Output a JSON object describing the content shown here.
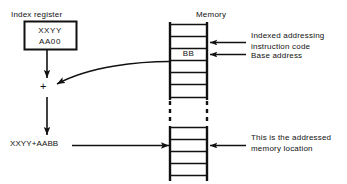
{
  "figure": {
    "stroke_color": "#111111",
    "background_color": "#ffffff"
  },
  "index_register": {
    "caption": "Index register",
    "line1": "XXYY",
    "line2": "AA00"
  },
  "operator": {
    "symbol": "+"
  },
  "result": {
    "label": "XXYY+AABB"
  },
  "memory": {
    "caption": "Memory",
    "cells": [
      {
        "value": ""
      },
      {
        "value": ""
      },
      {
        "value": "BB"
      },
      {
        "value": ""
      },
      {
        "value": ""
      },
      {
        "value": ""
      }
    ],
    "break_marker": "dashed-vertical-ellipsis",
    "lower_cells": [
      {
        "value": ""
      },
      {
        "value": ""
      },
      {
        "value": ""
      },
      {
        "value": ""
      }
    ]
  },
  "annotations": {
    "instruction_code_line1": "Indexed addressing",
    "instruction_code_line2": "instruction code",
    "base_address": "Base address",
    "addressed_location_line1": "This is the addressed",
    "addressed_location_line2": "memory location"
  }
}
